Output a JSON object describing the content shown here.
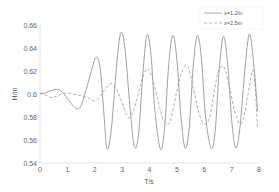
{
  "chart_data": {
    "type": "line",
    "title": "",
    "xlabel": "T/s",
    "ylabel": "H/m",
    "xlim": [
      0,
      8
    ],
    "ylim": [
      0.54,
      0.66
    ],
    "xticks": [
      0,
      1,
      2,
      3,
      4,
      5,
      6,
      7,
      8
    ],
    "yticks": [
      0.54,
      0.56,
      0.58,
      0.6,
      0.62,
      0.64,
      0.66
    ],
    "ytick_labels": [
      "0.54",
      "0.56",
      "0.58",
      "0.6",
      "0.62",
      "0.64",
      "0.66"
    ],
    "grid": false,
    "legend_position": "upper right",
    "series": [
      {
        "name": "x=1.2m",
        "style": "solid",
        "color": "#888888",
        "x": [
          0,
          0.2,
          0.4,
          0.6,
          0.8,
          1.0,
          1.2,
          1.35,
          1.5,
          1.7,
          1.9,
          2.05,
          2.2,
          2.35,
          2.45,
          2.6,
          2.8,
          2.95,
          3.1,
          3.3,
          3.45,
          3.6,
          3.75,
          3.9,
          4.05,
          4.2,
          4.4,
          4.55,
          4.7,
          4.85,
          5.0,
          5.15,
          5.3,
          5.45,
          5.6,
          5.75,
          5.9,
          6.05,
          6.25,
          6.4,
          6.55,
          6.7,
          6.85,
          7.0,
          7.15,
          7.3,
          7.5,
          7.65,
          7.8,
          7.95
        ],
        "y": [
          0.6,
          0.601,
          0.603,
          0.604,
          0.602,
          0.596,
          0.59,
          0.587,
          0.59,
          0.605,
          0.622,
          0.632,
          0.622,
          0.578,
          0.552,
          0.568,
          0.625,
          0.653,
          0.64,
          0.585,
          0.554,
          0.565,
          0.615,
          0.651,
          0.635,
          0.585,
          0.552,
          0.57,
          0.625,
          0.651,
          0.63,
          0.58,
          0.553,
          0.57,
          0.625,
          0.651,
          0.63,
          0.58,
          0.553,
          0.568,
          0.622,
          0.65,
          0.628,
          0.578,
          0.553,
          0.57,
          0.625,
          0.652,
          0.628,
          0.585
        ]
      },
      {
        "name": "x=2.5m",
        "style": "dashed",
        "color": "#999999",
        "x": [
          0,
          0.2,
          0.4,
          0.6,
          0.8,
          1.0,
          1.2,
          1.4,
          1.6,
          1.8,
          2.0,
          2.2,
          2.4,
          2.6,
          2.8,
          3.0,
          3.2,
          3.35,
          3.5,
          3.7,
          3.9,
          4.1,
          4.3,
          4.5,
          4.7,
          4.85,
          5.0,
          5.2,
          5.4,
          5.6,
          5.8,
          6.0,
          6.2,
          6.35,
          6.5,
          6.7,
          6.9,
          7.1,
          7.3,
          7.45,
          7.6,
          7.8,
          7.95
        ],
        "y": [
          0.601,
          0.599,
          0.597,
          0.598,
          0.6,
          0.601,
          0.6,
          0.599,
          0.598,
          0.596,
          0.594,
          0.598,
          0.605,
          0.609,
          0.604,
          0.592,
          0.58,
          0.582,
          0.592,
          0.61,
          0.622,
          0.614,
          0.595,
          0.578,
          0.574,
          0.585,
          0.603,
          0.62,
          0.624,
          0.605,
          0.584,
          0.574,
          0.58,
          0.6,
          0.618,
          0.624,
          0.608,
          0.586,
          0.574,
          0.58,
          0.6,
          0.62,
          0.57
        ]
      }
    ]
  },
  "legend": {
    "items": [
      {
        "label": "x=1.2m",
        "style": "solid"
      },
      {
        "label": "x=2.5m",
        "style": "dashed"
      }
    ]
  },
  "axes": {
    "xlabel": "T/s",
    "ylabel": "H/m",
    "xtick_labels": [
      "0",
      "1",
      "2",
      "3",
      "4",
      "5",
      "6",
      "7",
      "8"
    ],
    "ytick_labels": [
      "0.54",
      "0.56",
      "0.58",
      "0.6",
      "0.62",
      "0.64",
      "0.66"
    ]
  },
  "colors": {
    "solid_line": "#888888",
    "dashed_line": "#999999",
    "axis": "#dddddd",
    "text": "#666666"
  }
}
